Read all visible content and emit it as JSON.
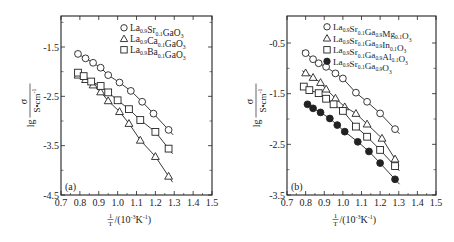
{
  "chart_data": [
    {
      "panel": "a",
      "type": "line",
      "panel_label": "(a)",
      "title": "",
      "xlabel": "1/T/(10^-3 K^-1)",
      "ylabel": "lg σ/(S•cm^-1)",
      "xlim": [
        0.7,
        1.5
      ],
      "ylim": [
        -4.5,
        -0.75
      ],
      "xticks": [
        0.7,
        0.8,
        0.9,
        1.0,
        1.1,
        1.2,
        1.3,
        1.4,
        1.5
      ],
      "xtick_labels": [
        "0.7",
        "0.8",
        "0.9",
        "1.0",
        "1.1",
        "1.2",
        "1.3",
        "1.4",
        "1.5"
      ],
      "yticks": [
        -1.5,
        -2.5,
        -3.5,
        -4.5
      ],
      "ytick_labels": [
        "-1.5",
        "-2.5",
        "-3.5",
        "-4.5"
      ],
      "grid": false,
      "legend_position": "upper right",
      "series": [
        {
          "name": "La0.9Sr0.1GaO3",
          "marker": "circle-open",
          "x": [
            0.79,
            0.83,
            0.87,
            0.91,
            0.95,
            1.01,
            1.07,
            1.13,
            1.19,
            1.27
          ],
          "y": [
            -1.64,
            -1.73,
            -1.82,
            -1.92,
            -2.07,
            -2.22,
            -2.39,
            -2.61,
            -2.85,
            -3.18
          ]
        },
        {
          "name": "La0.9Ca0.1GaO3",
          "marker": "triangle-open",
          "x": [
            0.79,
            0.83,
            0.87,
            0.91,
            0.95,
            1.01,
            1.06,
            1.12,
            1.2,
            1.27
          ],
          "y": [
            -2.07,
            -2.16,
            -2.27,
            -2.41,
            -2.59,
            -2.81,
            -3.05,
            -3.39,
            -3.72,
            -4.12
          ]
        },
        {
          "name": "La0.9Ba0.1GaO3",
          "marker": "square-open",
          "x": [
            0.79,
            0.82,
            0.86,
            0.91,
            0.95,
            1.0,
            1.06,
            1.12,
            1.2,
            1.27
          ],
          "y": [
            -2.02,
            -2.09,
            -2.2,
            -2.29,
            -2.42,
            -2.58,
            -2.76,
            -2.98,
            -3.22,
            -3.56
          ]
        }
      ]
    },
    {
      "panel": "b",
      "type": "line",
      "panel_label": "(b)",
      "title": "",
      "xlabel": "1/T/(10^-3 K^-1)",
      "ylabel": "lg σ/(S•cm^-1)",
      "xlim": [
        0.7,
        1.5
      ],
      "ylim": [
        -3.5,
        0.0
      ],
      "xticks": [
        0.7,
        0.8,
        0.9,
        1.0,
        1.1,
        1.2,
        1.3,
        1.4,
        1.5
      ],
      "xtick_labels": [
        "0.7",
        "0.8",
        "0.9",
        "1.0",
        "1.1",
        "1.2",
        "1.3",
        "1.4",
        "1.5"
      ],
      "yticks": [
        -0.5,
        -1.5,
        -2.5,
        -3.5
      ],
      "ytick_labels": [
        "-0.5",
        "-1.5",
        "-2.5",
        "-3.5"
      ],
      "grid": false,
      "legend_position": "upper right",
      "series": [
        {
          "name": "La0.9Sr0.1Ga0.9Mg0.1O3",
          "marker": "circle-open",
          "x": [
            0.8,
            0.84,
            0.87,
            0.91,
            0.96,
            1.0,
            1.07,
            1.13,
            1.2,
            1.28
          ],
          "y": [
            -0.7,
            -0.82,
            -0.9,
            -0.97,
            -1.1,
            -1.2,
            -1.48,
            -1.66,
            -1.89,
            -2.2
          ]
        },
        {
          "name": "La0.9Sr0.1Ga0.9In0.1O3",
          "marker": "triangle-open",
          "x": [
            0.8,
            0.84,
            0.88,
            0.91,
            0.96,
            1.01,
            1.07,
            1.13,
            1.21,
            1.28
          ],
          "y": [
            -1.09,
            -1.18,
            -1.28,
            -1.41,
            -1.59,
            -1.76,
            -1.89,
            -2.1,
            -2.38,
            -2.79
          ]
        },
        {
          "name": "La0.9Sr0.1Ga0.9Al0.1O3",
          "marker": "square-open",
          "x": [
            0.79,
            0.82,
            0.87,
            0.91,
            0.95,
            1.0,
            1.07,
            1.13,
            1.2,
            1.28
          ],
          "y": [
            -1.36,
            -1.43,
            -1.49,
            -1.6,
            -1.71,
            -1.84,
            -2.15,
            -2.35,
            -2.61,
            -2.93
          ]
        },
        {
          "name": "La0.9Sr0.1Ga0.9O3",
          "marker": "circle-filled",
          "x": [
            0.81,
            0.84,
            0.88,
            0.93,
            0.97,
            1.01,
            1.08,
            1.14,
            1.2,
            1.28
          ],
          "y": [
            -1.71,
            -1.79,
            -1.87,
            -1.99,
            -2.12,
            -2.25,
            -2.45,
            -2.64,
            -2.87,
            -3.19
          ]
        }
      ]
    }
  ],
  "panels": [
    {
      "label": "(a)",
      "legend": [
        {
          "base": "La",
          "parts": [
            [
              "La",
              "0.9"
            ],
            [
              "Sr",
              "0.1"
            ],
            [
              "GaO",
              "3"
            ]
          ]
        },
        {
          "parts": [
            [
              "La",
              "0.9"
            ],
            [
              "Ca",
              "0.1"
            ],
            [
              "GaO",
              "3"
            ]
          ]
        },
        {
          "parts": [
            [
              "La",
              "0.9"
            ],
            [
              "Ba",
              "0.1"
            ],
            [
              "GaO",
              "3"
            ]
          ]
        }
      ]
    },
    {
      "label": "(b)",
      "legend": [
        {
          "parts": [
            [
              "La",
              "0.9"
            ],
            [
              "Sr",
              "0.1"
            ],
            [
              "Ga",
              "0.9"
            ],
            [
              "Mg",
              "0.1"
            ],
            [
              "O",
              "3"
            ]
          ]
        },
        {
          "parts": [
            [
              "La",
              "0.9"
            ],
            [
              "Sr",
              "0.1"
            ],
            [
              "Ga",
              "0.9"
            ],
            [
              "In",
              "0.1"
            ],
            [
              "O",
              "3"
            ]
          ]
        },
        {
          "parts": [
            [
              "La",
              "0.9"
            ],
            [
              "Sr",
              "0.1"
            ],
            [
              "Ga",
              "0.9"
            ],
            [
              "Al",
              "0.1"
            ],
            [
              "O",
              "3"
            ]
          ]
        },
        {
          "parts": [
            [
              "La",
              "0.9"
            ],
            [
              "Sr",
              "0.1"
            ],
            [
              "Ga",
              "0.9"
            ],
            [
              "O",
              "3"
            ]
          ]
        }
      ]
    }
  ],
  "axis_text": {
    "ylabel_prefix": "lg",
    "ylabel_num": "σ",
    "ylabel_den": "S•cm",
    "ylabel_den_sup": "-1",
    "xlabel_num": "1",
    "xlabel_den": "T",
    "xlabel_rest": "/(10",
    "xlabel_sup1": "-3",
    "xlabel_k": "K",
    "xlabel_sup2": "-1",
    "xlabel_close": ")"
  },
  "colors": {
    "ink": "#222222",
    "background": "#ffffff"
  }
}
